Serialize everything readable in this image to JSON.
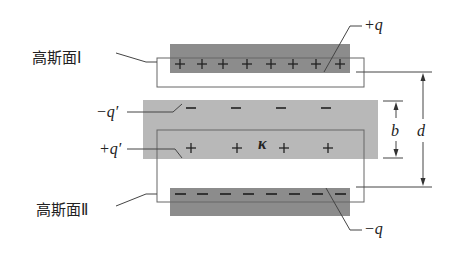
{
  "figure": {
    "colors": {
      "plate": "#8c8c8c",
      "dielectric": "#b8b8b8",
      "outline": "#555555",
      "background": "#ffffff"
    },
    "labels": {
      "gauss_1": "高斯面Ⅰ",
      "gauss_2": "高斯面Ⅱ",
      "plus_q": "+q",
      "minus_q": "−q",
      "minus_q_prime": "−q′",
      "plus_q_prime": "+q′",
      "kappa": "κ",
      "b": "b",
      "d": "d"
    },
    "top_plate": {
      "charge_sign": "+",
      "charge_count": 8
    },
    "bottom_plate": {
      "charge_sign": "−",
      "charge_count": 8
    },
    "dielectric_top_charges": {
      "charge_sign": "−",
      "charge_count": 4
    },
    "dielectric_bottom_charges": {
      "charge_sign": "+",
      "charge_count": 4
    }
  }
}
